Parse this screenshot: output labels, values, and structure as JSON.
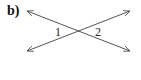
{
  "problem": {
    "part_label": "b)"
  },
  "diagram": {
    "line_color": "#555555",
    "lines": [
      {
        "name": "line-descending",
        "x1": 27,
        "y1": 11,
        "x2": 130,
        "y2": 51,
        "arrows": "both"
      },
      {
        "name": "line-ascending",
        "x1": 27,
        "y1": 51,
        "x2": 130,
        "y2": 11,
        "arrows": "both"
      }
    ],
    "intersection": {
      "x": 78,
      "y": 31
    },
    "angles": [
      {
        "label": "1",
        "x": 55,
        "y": 36
      },
      {
        "label": "2",
        "x": 95,
        "y": 36
      }
    ]
  }
}
